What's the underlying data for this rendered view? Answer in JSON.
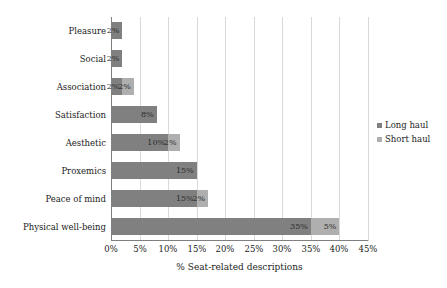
{
  "chart_data": {
    "type": "bar",
    "orientation": "horizontal",
    "stacked": true,
    "title": "",
    "xlabel": "% Seat-related descriptions",
    "ylabel": "",
    "xlim": [
      0,
      45
    ],
    "xticks": [
      "0%",
      "5%",
      "10%",
      "15%",
      "20%",
      "25%",
      "30%",
      "35%",
      "40%",
      "45%"
    ],
    "xtick_values": [
      0,
      5,
      10,
      15,
      20,
      25,
      30,
      35,
      40,
      45
    ],
    "grid": "vertical",
    "legend_position": "right",
    "categories": [
      "Pleasure",
      "Social",
      "Association",
      "Satisfaction",
      "Aesthetic",
      "Proxemics",
      "Peace of mind",
      "Physical well-being"
    ],
    "series": [
      {
        "name": "Long haul",
        "color": "#808080",
        "values": [
          2,
          2,
          2,
          8,
          10,
          15,
          15,
          35
        ],
        "labels": [
          "2%",
          "2%",
          "2%",
          "8%",
          "10%",
          "15%",
          "15%",
          "35%"
        ]
      },
      {
        "name": "Short haul",
        "color": "#afafaf",
        "values": [
          0,
          0,
          2,
          0,
          2,
          0,
          2,
          5
        ],
        "labels": [
          "",
          "",
          "2%",
          "",
          "2%",
          "",
          "2%",
          "5%"
        ]
      }
    ]
  },
  "legend": {
    "items": [
      {
        "label": "Long haul",
        "color": "#808080"
      },
      {
        "label": "Short haul",
        "color": "#afafaf"
      }
    ]
  },
  "axis": {
    "x_title": "% Seat-related descriptions"
  },
  "colors": {
    "long_haul": "#808080",
    "short_haul": "#afafaf",
    "gridline": "#d9d9d9",
    "axis": "#7f7f7f",
    "text": "#1c1c1c",
    "background": "#ffffff"
  }
}
